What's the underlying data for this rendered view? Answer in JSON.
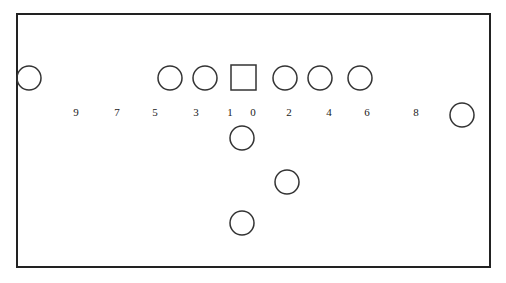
{
  "diagram": {
    "type": "football-formation",
    "frame": {
      "x": 17,
      "y": 14,
      "w": 473,
      "h": 253,
      "stroke": "#222222"
    },
    "center_square": {
      "x": 231,
      "y": 65,
      "size": 25
    },
    "players": [
      {
        "id": "split-end-left",
        "cx": 29,
        "cy": 78
      },
      {
        "id": "tackle-left",
        "cx": 170,
        "cy": 78
      },
      {
        "id": "guard-left",
        "cx": 205,
        "cy": 78
      },
      {
        "id": "guard-right",
        "cx": 285,
        "cy": 78
      },
      {
        "id": "tackle-right",
        "cx": 320,
        "cy": 78
      },
      {
        "id": "end-right",
        "cx": 360,
        "cy": 78
      },
      {
        "id": "flanker-right",
        "cx": 462,
        "cy": 115
      },
      {
        "id": "quarterback",
        "cx": 242,
        "cy": 138
      },
      {
        "id": "halfback",
        "cx": 287,
        "cy": 182
      },
      {
        "id": "fullback",
        "cx": 242,
        "cy": 223
      }
    ],
    "player_radius": 12,
    "hole_numbers": [
      {
        "label": "9",
        "x": 76,
        "y": 116
      },
      {
        "label": "7",
        "x": 117,
        "y": 116
      },
      {
        "label": "5",
        "x": 155,
        "y": 116
      },
      {
        "label": "3",
        "x": 196,
        "y": 116
      },
      {
        "label": "1",
        "x": 230,
        "y": 116
      },
      {
        "label": "0",
        "x": 253,
        "y": 116
      },
      {
        "label": "2",
        "x": 289,
        "y": 116
      },
      {
        "label": "4",
        "x": 329,
        "y": 116
      },
      {
        "label": "6",
        "x": 367,
        "y": 116
      },
      {
        "label": "8",
        "x": 416,
        "y": 116
      }
    ]
  }
}
